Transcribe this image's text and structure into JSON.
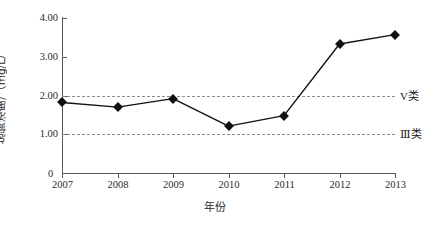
{
  "chart_data": {
    "type": "line",
    "title": "",
    "subtitle": "",
    "xlabel": "年份",
    "ylabel": "总氮浓度/（mg/L）",
    "categories": [
      "2007",
      "2008",
      "2009",
      "2010",
      "2011",
      "2012",
      "2013"
    ],
    "series": [
      {
        "name": "总氮浓度",
        "values": [
          1.82,
          1.7,
          1.92,
          1.21,
          1.48,
          3.33,
          3.57
        ],
        "marker": "diamond",
        "color": "#111111"
      }
    ],
    "ylim": [
      0,
      4.0
    ],
    "ytick_labels": [
      "0",
      "1.00",
      "2.00",
      "3.00",
      "4.00"
    ],
    "ytick_values": [
      0,
      1.0,
      2.0,
      3.0,
      4.0
    ],
    "xtick_labels": [
      "2007",
      "2008",
      "2009",
      "2010",
      "2011",
      "2012",
      "2013"
    ],
    "grid": false,
    "legend_position": "right-inline",
    "reference_lines": [
      {
        "label": "V类",
        "value": 2.0,
        "style": "dashed",
        "color": "#8d8d90"
      },
      {
        "label": "Ⅲ类",
        "value": 1.0,
        "style": "dashed",
        "color": "#8d8d90"
      }
    ]
  },
  "axis": {
    "y_title": "总氮浓度/（mg/L）",
    "x_title": "年份",
    "zero_label": "0"
  },
  "ticks": {
    "y": [
      {
        "label": "4.00",
        "value": 4.0
      },
      {
        "label": "3.00",
        "value": 3.0
      },
      {
        "label": "2.00",
        "value": 2.0
      },
      {
        "label": "1.00",
        "value": 1.0
      },
      {
        "label": "0",
        "value": 0
      }
    ],
    "x": [
      {
        "label": "2007"
      },
      {
        "label": "2008"
      },
      {
        "label": "2009"
      },
      {
        "label": "2010"
      },
      {
        "label": "2011"
      },
      {
        "label": "2012"
      },
      {
        "label": "2013"
      }
    ]
  },
  "reference_labels": {
    "upper": "V类",
    "lower": "Ⅲ类"
  },
  "colors": {
    "axis": "#58585a",
    "series": "#111111",
    "reference": "#8d8d90",
    "background": "#ffffff",
    "text": "#2b2b2b"
  }
}
